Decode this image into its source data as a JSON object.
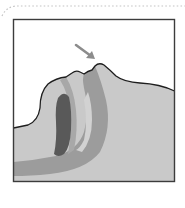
{
  "figure": {
    "alt_text": "Side cross-section of a sleeping person's head and airway with an arrow pointing at the nose",
    "arrow_target": "nose",
    "colors": {
      "card_border_dotted": "#c4c4c4",
      "frame_border": "#3c3c3c",
      "background": "#ffffff",
      "tissue_fill": "#c9c9c9",
      "airway_band": "#9c9c9c",
      "throat_band": "#a6a6a6",
      "tongue": "#595959",
      "outline": "#1e1e1e",
      "arrow": "#8c8c8c"
    }
  }
}
